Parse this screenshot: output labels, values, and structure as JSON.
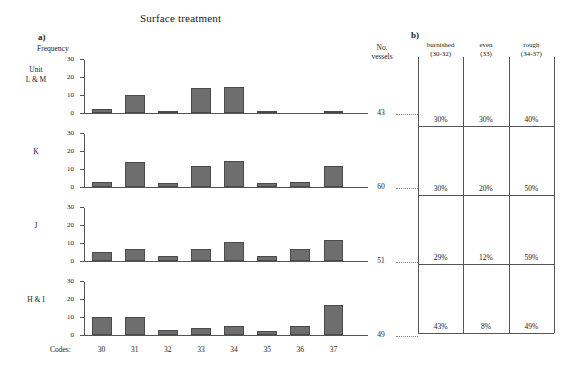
{
  "figure": {
    "title": "Surface treatment",
    "panel_a_letter": "a)",
    "panel_b_letter": "b)",
    "y_axis_label": "Frequency",
    "no_vessels_header": "No.\nvessels",
    "no_vessels_line1": "No.",
    "no_vessels_line2": "vessels",
    "codes_label": "Codes:",
    "caption": ""
  },
  "chart_data": {
    "type": "bar",
    "title": "Surface treatment",
    "xlabel": "Codes",
    "ylabel": "Frequency",
    "ylim": [
      0,
      30
    ],
    "yticks": [
      0,
      10,
      20,
      30
    ],
    "grid": false,
    "legend": "none",
    "categories": [
      "30",
      "31",
      "32",
      "33",
      "34",
      "35",
      "36",
      "37"
    ],
    "series": [
      {
        "name": "Unit L & M",
        "values": [
          2,
          10,
          1,
          14,
          15,
          1,
          0,
          1
        ],
        "no_vessels": 43
      },
      {
        "name": "K",
        "values": [
          3,
          14,
          2,
          12,
          15,
          2,
          3,
          12
        ],
        "no_vessels": 60
      },
      {
        "name": "J",
        "values": [
          5,
          7,
          3,
          7,
          11,
          3,
          7,
          12
        ],
        "no_vessels": 51
      },
      {
        "name": "H & I",
        "values": [
          10,
          10,
          3,
          4,
          5,
          2,
          5,
          17
        ],
        "no_vessels": 49
      }
    ]
  },
  "panel_b": {
    "columns": [
      {
        "name": "burnished",
        "codes": "(30-32)"
      },
      {
        "name": "even",
        "codes": "(33)"
      },
      {
        "name": "rough",
        "codes": "(34-37)"
      }
    ],
    "rows": [
      {
        "unit": "Unit L & M",
        "values": [
          "30%",
          "30%",
          "40%"
        ]
      },
      {
        "unit": "K",
        "values": [
          "30%",
          "20%",
          "50%"
        ]
      },
      {
        "unit": "J",
        "values": [
          "29%",
          "12%",
          "59%"
        ]
      },
      {
        "unit": "H & I",
        "values": [
          "43%",
          "8%",
          "49%"
        ]
      }
    ]
  },
  "row_labels": [
    {
      "line1": "Unit",
      "line2": "L & M"
    },
    {
      "line1": "K",
      "line2": ""
    },
    {
      "line1": "J",
      "line2": ""
    },
    {
      "line1": "H & I",
      "line2": ""
    }
  ],
  "colors": {
    "bar_fill": "#6e6e6e",
    "bar_stroke": "#4a4a4a",
    "axis": "#555555",
    "text": "#1a1a1a"
  }
}
